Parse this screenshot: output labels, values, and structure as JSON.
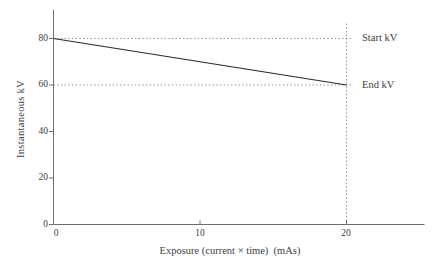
{
  "chart_data": {
    "type": "line",
    "title": "",
    "xlabel": "Exposure (current × time)  (mAs)",
    "ylabel": "Instantaneous kV",
    "x_ticks": [
      0,
      10,
      20
    ],
    "y_ticks": [
      0,
      20,
      40,
      60,
      80
    ],
    "xlim": [
      0,
      25.3
    ],
    "ylim": [
      0,
      92
    ],
    "grid": false,
    "legend": "none",
    "series": [
      {
        "x": [
          0,
          20
        ],
        "y": [
          80,
          60
        ]
      }
    ],
    "annotations": [
      {
        "label": "Start kV",
        "x": 21,
        "y": 80
      },
      {
        "label": "End kV",
        "x": 21,
        "y": 60
      }
    ],
    "reference_lines": [
      {
        "type": "horizontal",
        "y": 80,
        "style": "dotted"
      },
      {
        "type": "horizontal",
        "y": 60,
        "style": "dotted"
      },
      {
        "type": "vertical",
        "x": 20,
        "style": "dotted"
      }
    ],
    "colors": {
      "series_line": "#2a2a2a",
      "axis": "#6e6e6e",
      "dotted_guide": "#8f8f8f",
      "text": "#404040"
    }
  }
}
